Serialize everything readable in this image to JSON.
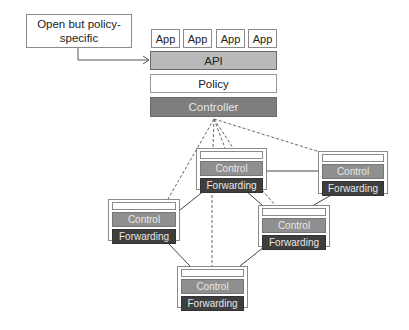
{
  "annotation": {
    "text": "Open but policy-specific",
    "line1": "Open but policy-",
    "line2": "specific"
  },
  "apps": [
    {
      "label": "App"
    },
    {
      "label": "App"
    },
    {
      "label": "App"
    },
    {
      "label": "App"
    }
  ],
  "stack": {
    "api": "API",
    "policy": "Policy",
    "controller": "Controller"
  },
  "switches": [
    {
      "id": "sw-top-center",
      "control": "Control",
      "forwarding": "Forwarding"
    },
    {
      "id": "sw-right",
      "control": "Control",
      "forwarding": "Forwarding"
    },
    {
      "id": "sw-left",
      "control": "Control",
      "forwarding": "Forwarding"
    },
    {
      "id": "sw-mid-right",
      "control": "Control",
      "forwarding": "Forwarding"
    },
    {
      "id": "sw-bottom",
      "control": "Control",
      "forwarding": "Forwarding"
    }
  ],
  "colors": {
    "api": "#b9b9b9",
    "controller": "#7e7e7e",
    "control": "#8f8f8f",
    "forwarding": "#3e3e3e"
  }
}
